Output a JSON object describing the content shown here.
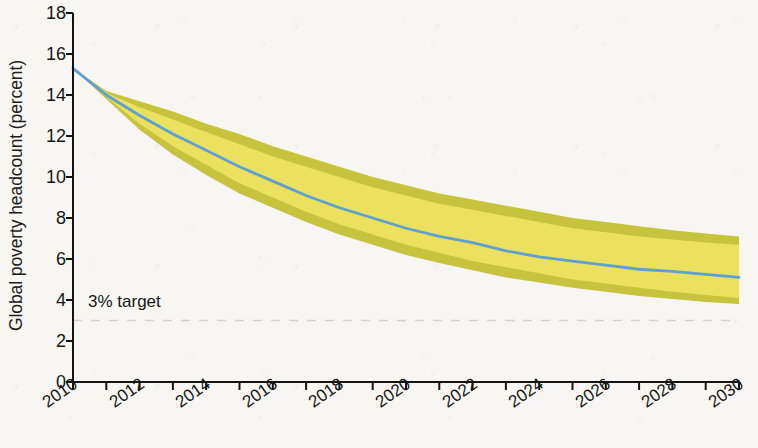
{
  "chart_data": {
    "type": "line",
    "title": "",
    "xlabel": "",
    "ylabel": "Global poverty headcount (percent)",
    "xlim": [
      2010,
      2030
    ],
    "ylim": [
      0,
      18
    ],
    "ytick_values": [
      0,
      2,
      4,
      6,
      8,
      10,
      12,
      14,
      16,
      18
    ],
    "ytick_labels": [
      "0",
      "2",
      "4",
      "6",
      "8",
      "10",
      "12",
      "14",
      "16",
      "18"
    ],
    "xtick_values": [
      2010,
      2012,
      2014,
      2016,
      2018,
      2020,
      2022,
      2024,
      2026,
      2028,
      2030
    ],
    "xtick_labels": [
      "2010",
      "2012",
      "2014",
      "2016",
      "2018",
      "2020",
      "2022",
      "2024",
      "2026",
      "2028",
      "2030"
    ],
    "x_minor_ticks": [
      2011,
      2013,
      2015,
      2017,
      2019,
      2021,
      2023,
      2025,
      2027,
      2029
    ],
    "grid": false,
    "legend": "none",
    "x": [
      2010,
      2011,
      2012,
      2013,
      2014,
      2015,
      2016,
      2017,
      2018,
      2019,
      2020,
      2021,
      2022,
      2023,
      2024,
      2025,
      2026,
      2027,
      2028,
      2029,
      2030
    ],
    "series": [
      {
        "name": "Projected global poverty headcount",
        "type": "line",
        "color": "#5e9fd4",
        "values": [
          15.3,
          14.0,
          13.0,
          12.1,
          11.3,
          10.5,
          9.8,
          9.1,
          8.5,
          8.0,
          7.5,
          7.1,
          6.8,
          6.4,
          6.1,
          5.9,
          5.7,
          5.5,
          5.4,
          5.25,
          5.1
        ]
      },
      {
        "name": "Inner uncertainty band (upper)",
        "type": "band-edge",
        "color": "#ece25f",
        "values": [
          15.3,
          14.1,
          13.4,
          12.8,
          12.2,
          11.6,
          11.0,
          10.5,
          10.0,
          9.5,
          9.1,
          8.7,
          8.4,
          8.1,
          7.8,
          7.5,
          7.3,
          7.1,
          6.95,
          6.8,
          6.7
        ]
      },
      {
        "name": "Inner uncertainty band (lower)",
        "type": "band-edge",
        "color": "#ece25f",
        "values": [
          15.3,
          13.9,
          12.6,
          11.5,
          10.6,
          9.7,
          9.0,
          8.3,
          7.7,
          7.2,
          6.7,
          6.3,
          5.9,
          5.6,
          5.3,
          5.0,
          4.8,
          4.6,
          4.4,
          4.25,
          4.1
        ]
      },
      {
        "name": "Outer uncertainty band (upper)",
        "type": "band-edge",
        "color": "#c4c032",
        "values": [
          15.3,
          14.2,
          13.7,
          13.2,
          12.6,
          12.1,
          11.5,
          11.0,
          10.5,
          10.0,
          9.6,
          9.2,
          8.9,
          8.6,
          8.3,
          8.0,
          7.8,
          7.6,
          7.4,
          7.25,
          7.1
        ]
      },
      {
        "name": "Outer uncertainty band (lower)",
        "type": "band-edge",
        "color": "#c4c032",
        "values": [
          15.3,
          13.8,
          12.3,
          11.1,
          10.1,
          9.2,
          8.5,
          7.8,
          7.2,
          6.7,
          6.2,
          5.8,
          5.45,
          5.1,
          4.85,
          4.6,
          4.4,
          4.2,
          4.05,
          3.9,
          3.8
        ]
      }
    ],
    "annotations": [
      {
        "name": "target-line",
        "label": "3% target",
        "value": 3,
        "style": "dashed",
        "color": "#b9b7b0"
      }
    ]
  },
  "colors": {
    "background": "#f7f6f2",
    "axis": "#141414",
    "line": "#5e9fd4",
    "band_inner": "#ece25f",
    "band_outer": "#c4c032",
    "target_dash": "#b9b7b0"
  }
}
